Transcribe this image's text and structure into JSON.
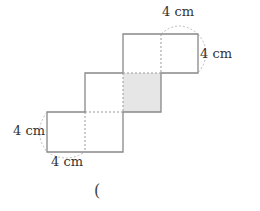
{
  "diagram": {
    "type": "cube-net",
    "unit_length": "4 cm",
    "colors": {
      "line": "#888888",
      "shaded": "#e6e6e6",
      "guide": "#999999"
    },
    "labels": [
      {
        "id": "top-width",
        "text": "4 cm"
      },
      {
        "id": "top-height",
        "text": "4 cm"
      },
      {
        "id": "bottom-height",
        "text": "4 cm"
      },
      {
        "id": "bottom-width",
        "text": "4 cm"
      }
    ],
    "answer_paren": "("
  }
}
